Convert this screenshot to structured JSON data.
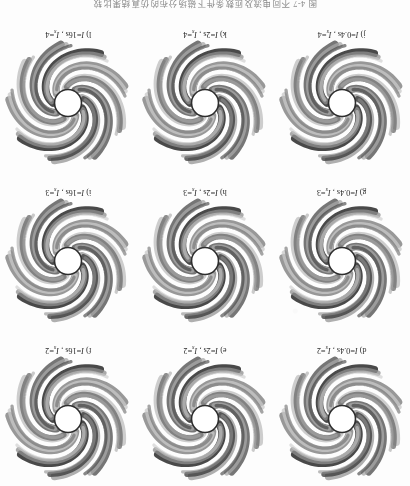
{
  "figure": {
    "caption_cn": "图 4-7   不同电流及匝数条件下磁场分布的仿真结果比较",
    "caption_visible_fragment": "图 4-7  不同电流及匝数条件下磁场分布的仿真结果比较",
    "orientation": "upside-down-scan",
    "grid": {
      "rows": 3,
      "cols": 3
    }
  },
  "panels": [
    {
      "id": "d",
      "label_prefix": "d)",
      "var1": "I",
      "eq1": "=0.4s",
      "var2": "I",
      "sub2": "s",
      "eq2": "=2",
      "caption": "d) I =0.4s , Is=2",
      "arms": 9,
      "chirality": "counterclockwise"
    },
    {
      "id": "e",
      "label_prefix": "e)",
      "var1": "I",
      "eq1": "=2s",
      "var2": "I",
      "sub2": "s",
      "eq2": "=2",
      "caption": "e) I =2s , Is=2",
      "arms": 9,
      "chirality": "counterclockwise"
    },
    {
      "id": "f",
      "label_prefix": "f)",
      "var1": "I",
      "eq1": "=16s",
      "var2": "I",
      "sub2": "s",
      "eq2": "=2",
      "caption": "f) I=16s , Is=2",
      "arms": 9,
      "chirality": "counterclockwise"
    },
    {
      "id": "g",
      "label_prefix": "g)",
      "var1": "I",
      "eq1": "=0.4s",
      "var2": "I",
      "sub2": "s",
      "eq2": "=3",
      "caption": "g) I =0.4s , Is=3",
      "arms": 9,
      "chirality": "counterclockwise"
    },
    {
      "id": "h",
      "label_prefix": "h)",
      "var1": "I",
      "eq1": "=2s",
      "var2": "I",
      "sub2": "s",
      "eq2": "=3",
      "caption": "h) I =2s , Is=3",
      "arms": 9,
      "chirality": "counterclockwise"
    },
    {
      "id": "i",
      "label_prefix": "i)",
      "var1": "I",
      "eq1": "=16s",
      "var2": "I",
      "sub2": "s",
      "eq2": "=3",
      "caption": "i) I =16s , Is=3",
      "arms": 9,
      "chirality": "counterclockwise"
    },
    {
      "id": "j",
      "label_prefix": "j)",
      "var1": "I",
      "eq1": "=0.4s",
      "var2": "I",
      "sub2": "s",
      "eq2": "=4",
      "caption": "j) I =0.4s , Is=4",
      "arms": 9,
      "chirality": "counterclockwise"
    },
    {
      "id": "k",
      "label_prefix": "k)",
      "var1": "I",
      "eq1": "=2s",
      "var2": "I",
      "sub2": "s",
      "eq2": "=4",
      "caption": "k) I =2s , Is=4",
      "arms": 9,
      "chirality": "counterclockwise"
    },
    {
      "id": "l",
      "label_prefix": "l)",
      "var1": "I",
      "eq1": "=16s",
      "var2": "I",
      "sub2": "s",
      "eq2": "=4",
      "caption": "l) I =16s , Is=4",
      "arms": 9,
      "chirality": "counterclockwise"
    }
  ],
  "colors": {
    "page_background": "#fdfdfd",
    "arm_dark": "#3a3a3a",
    "arm_mid": "#8f8f8f",
    "arm_light": "#c9c9c9",
    "core_fill": "#ffffff",
    "core_stroke": "#2e2e2e",
    "caption_text": "#2b2b2b",
    "figure_caption_text": "#6d6d6d"
  }
}
